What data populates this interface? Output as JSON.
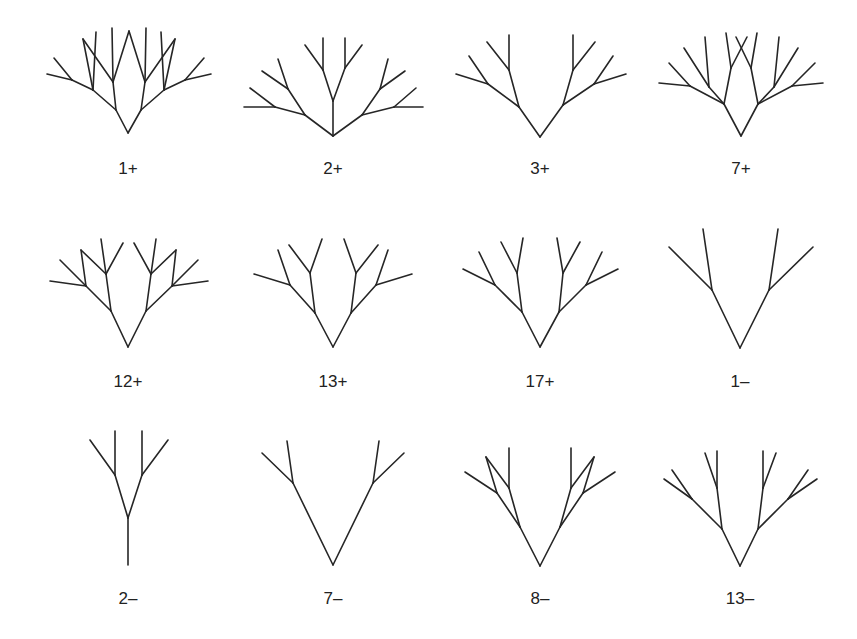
{
  "figure": {
    "stroke_color": "#262626",
    "background": "#ffffff"
  },
  "trees": [
    {
      "label": "1+",
      "label_pos": [
        128,
        174
      ],
      "segments": [
        [
          128,
          133,
          116,
          110
        ],
        [
          128,
          133,
          141,
          110
        ],
        [
          116,
          110,
          113,
          82
        ],
        [
          113,
          82,
          112,
          28
        ],
        [
          113,
          82,
          129,
          31
        ],
        [
          141,
          110,
          145,
          82
        ],
        [
          145,
          82,
          146,
          28
        ],
        [
          145,
          82,
          129,
          31
        ],
        [
          116,
          110,
          93,
          90
        ],
        [
          93,
          90,
          96,
          32
        ],
        [
          93,
          90,
          83,
          39
        ],
        [
          83,
          39,
          113,
          82
        ],
        [
          93,
          90,
          72,
          80
        ],
        [
          72,
          80,
          47,
          74
        ],
        [
          72,
          80,
          54,
          58
        ],
        [
          141,
          110,
          164,
          90
        ],
        [
          164,
          90,
          161,
          32
        ],
        [
          164,
          90,
          175,
          39
        ],
        [
          175,
          39,
          145,
          82
        ],
        [
          164,
          90,
          185,
          80
        ],
        [
          185,
          80,
          211,
          74
        ],
        [
          185,
          80,
          204,
          58
        ]
      ]
    },
    {
      "label": "2+",
      "label_pos": [
        333,
        174
      ],
      "segments": [
        [
          333,
          136,
          333,
          101
        ],
        [
          333,
          101,
          323,
          70
        ],
        [
          333,
          101,
          345,
          68
        ],
        [
          323,
          70,
          323,
          38
        ],
        [
          323,
          70,
          305,
          45
        ],
        [
          345,
          68,
          345,
          38
        ],
        [
          345,
          68,
          362,
          45
        ],
        [
          333,
          136,
          305,
          115
        ],
        [
          305,
          115,
          275,
          107
        ],
        [
          275,
          107,
          244,
          107
        ],
        [
          275,
          107,
          250,
          88
        ],
        [
          305,
          115,
          288,
          89
        ],
        [
          288,
          89,
          262,
          71
        ],
        [
          288,
          89,
          278,
          59
        ],
        [
          333,
          136,
          362,
          115
        ],
        [
          362,
          115,
          394,
          107
        ],
        [
          394,
          107,
          423,
          107
        ],
        [
          394,
          107,
          416,
          88
        ],
        [
          362,
          115,
          380,
          89
        ],
        [
          380,
          89,
          405,
          71
        ],
        [
          380,
          89,
          388,
          59
        ]
      ]
    },
    {
      "label": "3+",
      "label_pos": [
        540,
        174
      ],
      "segments": [
        [
          540,
          137,
          519,
          107
        ],
        [
          540,
          137,
          563,
          105
        ],
        [
          519,
          107,
          509,
          70
        ],
        [
          509,
          70,
          509,
          35
        ],
        [
          509,
          70,
          487,
          42
        ],
        [
          519,
          107,
          488,
          84
        ],
        [
          488,
          84,
          456,
          74
        ],
        [
          488,
          84,
          469,
          56
        ],
        [
          563,
          105,
          573,
          70
        ],
        [
          573,
          70,
          573,
          35
        ],
        [
          573,
          70,
          595,
          42
        ],
        [
          563,
          105,
          594,
          84
        ],
        [
          594,
          84,
          626,
          74
        ],
        [
          594,
          84,
          613,
          56
        ]
      ]
    },
    {
      "label": "7+",
      "label_pos": [
        741,
        174
      ],
      "segments": [
        [
          741,
          136,
          724,
          104
        ],
        [
          741,
          136,
          758,
          104
        ],
        [
          724,
          104,
          709,
          87
        ],
        [
          709,
          87,
          684,
          48
        ],
        [
          709,
          87,
          705,
          37
        ],
        [
          724,
          104,
          690,
          86
        ],
        [
          690,
          86,
          659,
          83
        ],
        [
          690,
          86,
          669,
          63
        ],
        [
          724,
          104,
          731,
          68
        ],
        [
          731,
          68,
          726,
          33
        ],
        [
          731,
          68,
          747,
          37
        ],
        [
          758,
          104,
          751,
          68
        ],
        [
          751,
          68,
          736,
          37
        ],
        [
          751,
          68,
          757,
          33
        ],
        [
          758,
          104,
          774,
          87
        ],
        [
          774,
          87,
          779,
          37
        ],
        [
          774,
          87,
          798,
          48
        ],
        [
          758,
          104,
          792,
          86
        ],
        [
          792,
          86,
          823,
          83
        ],
        [
          792,
          86,
          815,
          63
        ]
      ]
    },
    {
      "label": "12+",
      "label_pos": [
        128,
        387
      ],
      "segments": [
        [
          128,
          347,
          111,
          311
        ],
        [
          128,
          347,
          146,
          311
        ],
        [
          111,
          311,
          106,
          274
        ],
        [
          106,
          274,
          101,
          239
        ],
        [
          106,
          274,
          123,
          243
        ],
        [
          111,
          311,
          86,
          286
        ],
        [
          86,
          286,
          50,
          281
        ],
        [
          86,
          286,
          60,
          260
        ],
        [
          86,
          286,
          81,
          250
        ],
        [
          81,
          250,
          106,
          274
        ],
        [
          146,
          311,
          151,
          274
        ],
        [
          151,
          274,
          156,
          239
        ],
        [
          151,
          274,
          134,
          243
        ],
        [
          146,
          311,
          172,
          286
        ],
        [
          172,
          286,
          208,
          281
        ],
        [
          172,
          286,
          198,
          260
        ],
        [
          172,
          286,
          176,
          250
        ],
        [
          176,
          250,
          151,
          274
        ]
      ]
    },
    {
      "label": "13+",
      "label_pos": [
        333,
        387
      ],
      "segments": [
        [
          333,
          347,
          315,
          313
        ],
        [
          333,
          347,
          351,
          313
        ],
        [
          315,
          313,
          310,
          273
        ],
        [
          310,
          273,
          322,
          239
        ],
        [
          310,
          273,
          289,
          245
        ],
        [
          315,
          313,
          290,
          285
        ],
        [
          290,
          285,
          254,
          274
        ],
        [
          290,
          285,
          278,
          250
        ],
        [
          351,
          313,
          356,
          273
        ],
        [
          356,
          273,
          344,
          239
        ],
        [
          356,
          273,
          378,
          245
        ],
        [
          351,
          313,
          376,
          285
        ],
        [
          376,
          285,
          412,
          274
        ],
        [
          376,
          285,
          388,
          250
        ]
      ]
    },
    {
      "label": "17+",
      "label_pos": [
        540,
        387
      ],
      "segments": [
        [
          540,
          347,
          522,
          312
        ],
        [
          540,
          347,
          559,
          312
        ],
        [
          522,
          312,
          517,
          273
        ],
        [
          517,
          273,
          523,
          238
        ],
        [
          517,
          273,
          501,
          242
        ],
        [
          522,
          312,
          495,
          285
        ],
        [
          495,
          285,
          463,
          269
        ],
        [
          495,
          285,
          479,
          252
        ],
        [
          559,
          312,
          563,
          273
        ],
        [
          563,
          273,
          557,
          238
        ],
        [
          563,
          273,
          580,
          242
        ],
        [
          559,
          312,
          586,
          285
        ],
        [
          586,
          285,
          618,
          269
        ],
        [
          586,
          285,
          602,
          252
        ]
      ]
    },
    {
      "label": "1–",
      "label_pos": [
        740,
        387
      ],
      "segments": [
        [
          740,
          348,
          712,
          290
        ],
        [
          740,
          348,
          769,
          290
        ],
        [
          712,
          290,
          703,
          229
        ],
        [
          712,
          290,
          669,
          247
        ],
        [
          769,
          290,
          778,
          229
        ],
        [
          769,
          290,
          813,
          247
        ]
      ]
    },
    {
      "label": "2–",
      "label_pos": [
        128,
        604
      ],
      "segments": [
        [
          128,
          565,
          128,
          518
        ],
        [
          128,
          518,
          115,
          475
        ],
        [
          115,
          475,
          115,
          431
        ],
        [
          115,
          475,
          90,
          440
        ],
        [
          128,
          518,
          142,
          475
        ],
        [
          142,
          475,
          142,
          431
        ],
        [
          142,
          475,
          168,
          440
        ]
      ]
    },
    {
      "label": "7–",
      "label_pos": [
        333,
        604
      ],
      "segments": [
        [
          333,
          565,
          293,
          483
        ],
        [
          333,
          565,
          373,
          483
        ],
        [
          293,
          483,
          287,
          441
        ],
        [
          293,
          483,
          262,
          453
        ],
        [
          373,
          483,
          379,
          441
        ],
        [
          373,
          483,
          404,
          453
        ]
      ]
    },
    {
      "label": "8–",
      "label_pos": [
        540,
        604
      ],
      "segments": [
        [
          540,
          566,
          520,
          527
        ],
        [
          540,
          566,
          560,
          527
        ],
        [
          520,
          527,
          509,
          488
        ],
        [
          509,
          488,
          509,
          448
        ],
        [
          509,
          488,
          486,
          457
        ],
        [
          520,
          527,
          497,
          493
        ],
        [
          497,
          493,
          486,
          457
        ],
        [
          497,
          493,
          465,
          472
        ],
        [
          560,
          527,
          571,
          488
        ],
        [
          571,
          488,
          571,
          448
        ],
        [
          571,
          488,
          594,
          457
        ],
        [
          560,
          527,
          583,
          493
        ],
        [
          583,
          493,
          594,
          457
        ],
        [
          583,
          493,
          615,
          472
        ]
      ]
    },
    {
      "label": "13–",
      "label_pos": [
        740,
        604
      ],
      "segments": [
        [
          740,
          566,
          722,
          529
        ],
        [
          740,
          566,
          758,
          529
        ],
        [
          722,
          529,
          717,
          488
        ],
        [
          717,
          488,
          717,
          451
        ],
        [
          717,
          488,
          705,
          453
        ],
        [
          722,
          529,
          692,
          499
        ],
        [
          692,
          499,
          664,
          479
        ],
        [
          692,
          499,
          672,
          470
        ],
        [
          758,
          529,
          763,
          488
        ],
        [
          763,
          488,
          763,
          451
        ],
        [
          763,
          488,
          776,
          453
        ],
        [
          758,
          529,
          788,
          499
        ],
        [
          788,
          499,
          817,
          479
        ],
        [
          788,
          499,
          808,
          470
        ]
      ]
    }
  ]
}
